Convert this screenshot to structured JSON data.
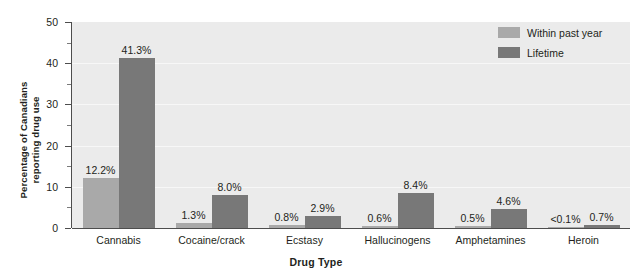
{
  "chart_data": {
    "type": "bar",
    "title": "",
    "xlabel": "Drug Type",
    "ylabel": "Percentage of Canadians reporting drug use",
    "ylabel_line1": "Percentage of Canadians",
    "ylabel_line2": "reporting drug use",
    "ylim": [
      0,
      50
    ],
    "y_ticks": [
      0,
      10,
      20,
      30,
      40,
      50
    ],
    "y_minor_ticks": [
      5,
      15,
      25,
      35,
      45
    ],
    "grid": true,
    "grid_axis": "y",
    "legend_position": "top-right",
    "categories": [
      "Cannabis",
      "Cocaine/crack",
      "Ecstasy",
      "Hallucinogens",
      "Amphetamines",
      "Heroin"
    ],
    "series": [
      {
        "name": "Within past year",
        "color": "#a9a9a9",
        "values": [
          12.2,
          1.3,
          0.8,
          0.6,
          0.5,
          0.05
        ],
        "labels": [
          "12.2%",
          "1.3%",
          "0.8%",
          "0.6%",
          "0.5%",
          "<0.1%"
        ]
      },
      {
        "name": "Lifetime",
        "color": "#787878",
        "values": [
          41.3,
          8.0,
          2.9,
          8.4,
          4.6,
          0.7
        ],
        "labels": [
          "41.3%",
          "8.0%",
          "2.9%",
          "8.4%",
          "4.6%",
          "0.7%"
        ]
      }
    ],
    "colors": {
      "past_year": "#a9a9a9",
      "lifetime": "#787878",
      "plot_background": "#ebebeb",
      "gridline": "#f7f7f7",
      "axis": "#4d4d4d",
      "text": "#231f20",
      "page_background": "#ffffff"
    }
  },
  "legend": {
    "items": [
      {
        "label": "Within past year",
        "swatch": "past-year"
      },
      {
        "label": "Lifetime",
        "swatch": "lifetime"
      }
    ]
  },
  "axes": {
    "x_title": "Drug Type",
    "y_title_line1": "Percentage of Canadians",
    "y_title_line2": "reporting drug use"
  }
}
